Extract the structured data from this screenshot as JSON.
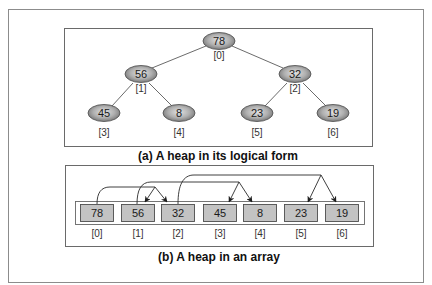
{
  "figure": {
    "colors": {
      "frame": "#8a8a8a",
      "node_fill_center": "#d8d8d8",
      "node_fill_edge": "#7a7a7a",
      "node_stroke": "#444444",
      "cell_fill": "#c4c4c4",
      "cell_stroke": "#555555",
      "edge": "#555555",
      "arrow": "#222222"
    }
  },
  "tree": {
    "caption": "(a) A heap in its logical form",
    "nodes": [
      {
        "value": "78",
        "index": "[0]"
      },
      {
        "value": "56",
        "index": "[1]"
      },
      {
        "value": "32",
        "index": "[2]"
      },
      {
        "value": "45",
        "index": "[3]"
      },
      {
        "value": "8",
        "index": "[4]"
      },
      {
        "value": "23",
        "index": "[5]"
      },
      {
        "value": "19",
        "index": "[6]"
      }
    ],
    "edges": [
      [
        "78",
        "56"
      ],
      [
        "78",
        "32"
      ],
      [
        "56",
        "45"
      ],
      [
        "56",
        "8"
      ],
      [
        "32",
        "23"
      ],
      [
        "32",
        "19"
      ]
    ]
  },
  "array": {
    "caption": "(b) A heap in an array",
    "cells": [
      {
        "value": "78",
        "index": "[0]"
      },
      {
        "value": "56",
        "index": "[1]"
      },
      {
        "value": "32",
        "index": "[2]"
      },
      {
        "value": "45",
        "index": "[3]"
      },
      {
        "value": "8",
        "index": "[4]"
      },
      {
        "value": "23",
        "index": "[5]"
      },
      {
        "value": "19",
        "index": "[6]"
      }
    ],
    "arrows": [
      {
        "from": "[0]",
        "to": [
          "[1]",
          "[2]"
        ]
      },
      {
        "from": "[1]",
        "to": [
          "[3]",
          "[4]"
        ]
      },
      {
        "from": "[2]",
        "to": [
          "[5]",
          "[6]"
        ]
      }
    ]
  }
}
